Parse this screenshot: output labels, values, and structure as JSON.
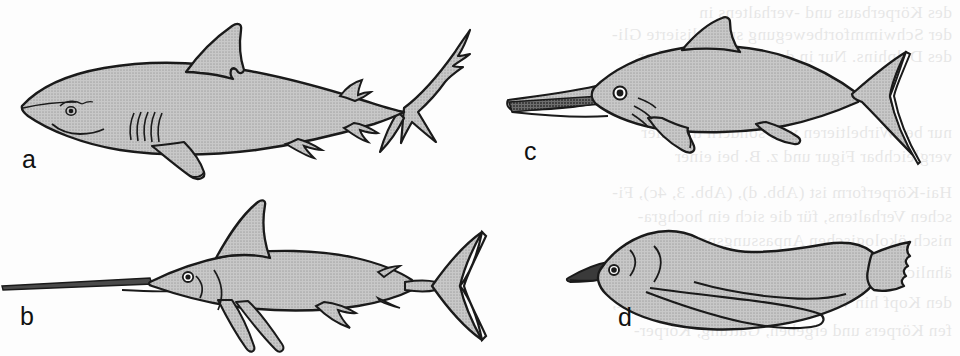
{
  "figure": {
    "background_color": "#fdfdfd",
    "ink_color": "#1a1a1a",
    "fill_color": "#b9b9b9",
    "dark_fill_color": "#3a3a3a",
    "panels": [
      {
        "id": "a",
        "label": "a",
        "subject": "shark",
        "label_x": 22,
        "label_y": 168,
        "features": [
          "dorsal-fin",
          "heterocercal-caudal-fin",
          "five-gill-slits",
          "pectoral-fin",
          "pelvic-fin",
          "anal-fin",
          "eye"
        ]
      },
      {
        "id": "b",
        "label": "b",
        "subject": "swordfish",
        "label_x": 20,
        "label_y": 325,
        "features": [
          "elongate-rostrum",
          "dorsal-fin",
          "lunate-caudal-fin",
          "pectoral-fin",
          "pelvic-fin",
          "eye",
          "operculum"
        ]
      },
      {
        "id": "c",
        "label": "c",
        "subject": "ichthyosaur",
        "label_x": 524,
        "label_y": 160,
        "features": [
          "toothed-rostrum",
          "dorsal-fin",
          "lunate-caudal-fin",
          "fore-paddle",
          "hind-paddle",
          "eye"
        ]
      },
      {
        "id": "d",
        "label": "d",
        "subject": "penguin",
        "label_x": 618,
        "label_y": 326,
        "features": [
          "beak",
          "flipper",
          "webbed-foot",
          "eye",
          "neck-contour"
        ]
      }
    ]
  },
  "bleed_through_text": {
    "note": "faint mirrored show-through text from the reverse side of the page",
    "lines": [
      {
        "text": "des Körperbaus und -verhaltens in",
        "x": 952,
        "y": 2
      },
      {
        "text": "der Schwimmfortbewegung spezialisierte Gli-",
        "x": 952,
        "y": 24
      },
      {
        "text": "des Delphins. Nur in der Gestalt scheinbar",
        "x": 952,
        "y": 46
      },
      {
        "text": "nur bei Wirbeltieren vor, sondern tritt hier",
        "x": 952,
        "y": 122
      },
      {
        "text": "vergleichbar Figur und z. B. bei einer",
        "x": 952,
        "y": 146
      },
      {
        "text": "Hai-Körperform ist (Abb. d), (Abb. 3, 4c), Fi-",
        "x": 952,
        "y": 182
      },
      {
        "text": "schen Verhaltens, für die sich ein hochgra-",
        "x": 952,
        "y": 206
      },
      {
        "text": "nisch-ökologischen Anpassungsparallelität",
        "x": 952,
        "y": 230
      },
      {
        "text": "ähnlich gestalteten Lebensweise entwickelt",
        "x": 952,
        "y": 262
      },
      {
        "text": "den Kopf hin verlagerten Körperschwerpunkt,",
        "x": 952,
        "y": 292
      },
      {
        "text": "fen Körpers und ergeben, Gattung, Körper-",
        "x": 952,
        "y": 320
      }
    ]
  }
}
